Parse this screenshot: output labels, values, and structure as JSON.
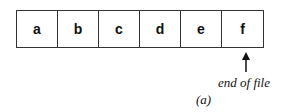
{
  "diagram": {
    "cells": [
      "a",
      "b",
      "c",
      "d",
      "e",
      "f"
    ],
    "pointer": {
      "target_cell": "f",
      "label": "end of file"
    },
    "caption": "(a)"
  }
}
